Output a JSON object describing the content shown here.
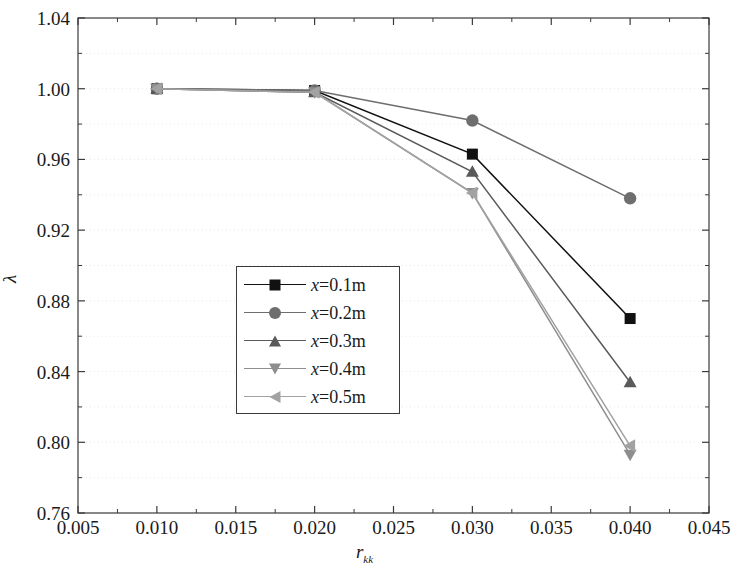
{
  "chart_data": {
    "type": "line",
    "title": "",
    "xlabel": "r",
    "xlabel_sub": "kk",
    "ylabel": "λ",
    "xlim": [
      0.005,
      0.045
    ],
    "ylim": [
      0.76,
      1.04
    ],
    "xticks": [
      "0.005",
      "0.010",
      "0.015",
      "0.020",
      "0.025",
      "0.030",
      "0.035",
      "0.040",
      "0.045"
    ],
    "xtick_values": [
      0.005,
      0.01,
      0.015,
      0.02,
      0.025,
      0.03,
      0.035,
      0.04,
      0.045
    ],
    "yticks": [
      "0.76",
      "0.80",
      "0.84",
      "0.88",
      "0.92",
      "0.96",
      "1.00",
      "1.04"
    ],
    "ytick_values": [
      0.76,
      0.8,
      0.84,
      0.88,
      0.92,
      0.96,
      1.0,
      1.04
    ],
    "minor_ticks": true,
    "grid": "horizontal-dotted",
    "grid_color": "#e8e8e8",
    "legend_position": "center-left",
    "x": [
      0.01,
      0.02,
      0.03,
      0.04
    ],
    "series": [
      {
        "name": "x=0.1m",
        "label_prefix": "x",
        "label_rest": "=0.1m",
        "marker": "square",
        "color": "#111111",
        "values": [
          1.0,
          0.999,
          0.963,
          0.87
        ]
      },
      {
        "name": "x=0.2m",
        "label_prefix": "x",
        "label_rest": "=0.2m",
        "marker": "circle",
        "color": "#6e6e6e",
        "values": [
          1.0,
          0.999,
          0.982,
          0.938
        ]
      },
      {
        "name": "x=0.3m",
        "label_prefix": "x",
        "label_rest": "=0.3m",
        "marker": "triangle-up",
        "color": "#5a5a5a",
        "values": [
          1.0,
          0.998,
          0.953,
          0.834
        ]
      },
      {
        "name": "x=0.4m",
        "label_prefix": "x",
        "label_rest": "=0.4m",
        "marker": "triangle-down",
        "color": "#8e8e8e",
        "values": [
          1.0,
          0.998,
          0.941,
          0.793
        ]
      },
      {
        "name": "x=0.5m",
        "label_prefix": "x",
        "label_rest": "=0.5m",
        "marker": "triangle-left",
        "color": "#a2a2a2",
        "values": [
          1.0,
          0.998,
          0.941,
          0.798
        ]
      }
    ]
  }
}
